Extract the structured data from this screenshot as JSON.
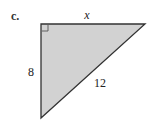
{
  "figure": {
    "part_label": "c.",
    "shape": "right-triangle",
    "fill_color": "#d2d2d2",
    "stroke_color": "#333333",
    "vertices": {
      "right_angle": [
        41,
        24
      ],
      "top_right": [
        145,
        24
      ],
      "bottom": [
        41,
        118
      ]
    },
    "sides": {
      "top": {
        "label": "x",
        "position": [
          87,
          18
        ]
      },
      "left": {
        "label": "8",
        "position": [
          30,
          74
        ]
      },
      "hypotenuse": {
        "label": "12",
        "position": [
          99,
          85
        ]
      }
    },
    "right_angle_marker": true
  }
}
